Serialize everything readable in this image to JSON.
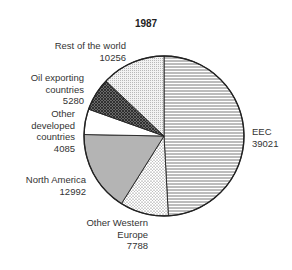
{
  "chart_data": {
    "type": "pie",
    "title": "1987",
    "start_angle_deg": 0,
    "direction": "clockwise",
    "slices": [
      {
        "label": "EEC",
        "value": 39021,
        "fill": "hlines"
      },
      {
        "label": "Other Western Europe",
        "value": 7788,
        "fill": "dots"
      },
      {
        "label": "North America",
        "value": 12992,
        "fill": "#b4b4b4"
      },
      {
        "label": "Other developed countries",
        "value": 4085,
        "fill": "#ffffff"
      },
      {
        "label": "Oil exporting countries",
        "value": 5280,
        "fill": "crosshatch"
      },
      {
        "label": "Rest of the world",
        "value": 10256,
        "fill": "finegrid"
      }
    ],
    "legend": "none",
    "grid": false
  },
  "labels": {
    "title": "1987",
    "eec": {
      "line1": "EEC",
      "line2": "39021"
    },
    "owe": {
      "line1": "Other Western",
      "line2": "Europe",
      "line3": "7788"
    },
    "na": {
      "line1": "North America",
      "line2": "12992"
    },
    "odc": {
      "line1": "Other",
      "line2": "developed",
      "line3": "countries",
      "line4": "4085"
    },
    "oil": {
      "line1": "Oil exporting",
      "line2": "countries",
      "line3": "5280"
    },
    "row": {
      "line1": "Rest of the world",
      "line2": "10256"
    }
  }
}
